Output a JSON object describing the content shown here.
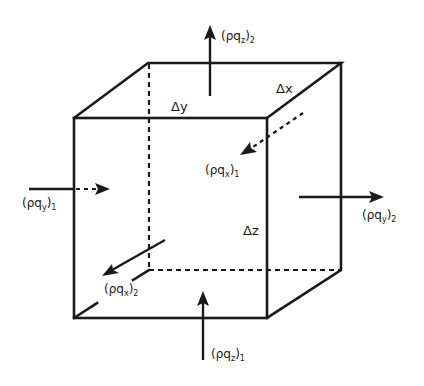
{
  "diagram": {
    "type": "control-volume-cube",
    "dimensions": {
      "dx": "Δx",
      "dy": "Δy",
      "dz": "Δz"
    },
    "fluxes": {
      "pqz_in": {
        "base": "(ρq",
        "sub": "z",
        "close": ")",
        "index": "1"
      },
      "pqz_out": {
        "base": "(ρq",
        "sub": "z",
        "close": ")",
        "index": "2"
      },
      "pqy_in": {
        "base": "(ρq",
        "sub": "y",
        "close": ")",
        "index": "1"
      },
      "pqy_out": {
        "base": "(ρq",
        "sub": "y",
        "close": ")",
        "index": "2"
      },
      "pqx_in": {
        "base": "(ρq",
        "sub": "x",
        "close": ")",
        "index": "1"
      },
      "pqx_out": {
        "base": "(ρq",
        "sub": "x",
        "close": ")",
        "index": "2"
      }
    },
    "colors": {
      "line": "#1a1a1a",
      "background": "#ffffff"
    }
  }
}
